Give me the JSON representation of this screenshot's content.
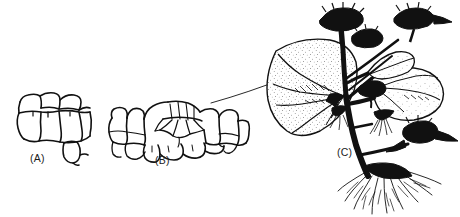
{
  "figure": {
    "background_color": "#ffffff",
    "ink_color": "#111111",
    "panels": [
      {
        "id": "A",
        "label": "(A)",
        "caption": "(A)",
        "subject": "leaf epidermal and mesophyll cells before bud initiation",
        "label_x": 30,
        "label_y": 152
      },
      {
        "id": "B",
        "label": "(B)",
        "caption": "(B)",
        "subject": "leaf tissue with a meristematic cell cluster forming an adventitious bud primordium",
        "label_x": 155,
        "label_y": 154
      },
      {
        "id": "C",
        "label": "(C)",
        "caption": "(C)",
        "subject": "whole plant with leaves bearing adventitious plantlets, flower heads and roots",
        "label_x": 337,
        "label_y": 146
      }
    ],
    "leader_line": {
      "name": "leader-line-B-to-C",
      "from_panel": "B",
      "to_panel": "C",
      "description": "thin curved line connecting the bud primordium region of (B) to the leaf surface of (C)"
    }
  }
}
